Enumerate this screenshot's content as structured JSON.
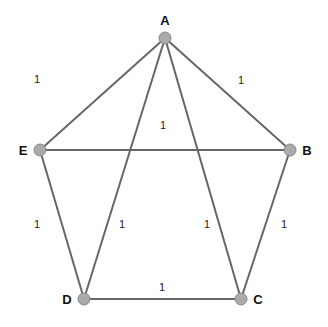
{
  "graph": {
    "nodes": [
      {
        "id": "A",
        "label": "A",
        "x": 165,
        "y": 38,
        "lx": 165,
        "ly": 25
      },
      {
        "id": "B",
        "label": "B",
        "x": 290,
        "y": 150,
        "lx": 307,
        "ly": 155
      },
      {
        "id": "C",
        "label": "C",
        "x": 241,
        "y": 299,
        "lx": 258,
        "ly": 304
      },
      {
        "id": "D",
        "label": "D",
        "x": 84,
        "y": 299,
        "lx": 67,
        "ly": 304
      },
      {
        "id": "E",
        "label": "E",
        "x": 40,
        "y": 150,
        "lx": 23,
        "ly": 155
      }
    ],
    "edges": [
      {
        "from": "A",
        "to": "E",
        "weight": "1",
        "lx": 37,
        "ly": 83
      },
      {
        "from": "A",
        "to": "B",
        "weight": "1",
        "lx": 241,
        "ly": 84
      },
      {
        "from": "E",
        "to": "B",
        "weight": "1",
        "lx": 163,
        "ly": 129
      },
      {
        "from": "E",
        "to": "D",
        "weight": "1",
        "lx": 37,
        "ly": 228
      },
      {
        "from": "A",
        "to": "D",
        "weight": "1",
        "lx": 122,
        "ly": 228
      },
      {
        "from": "A",
        "to": "C",
        "weight": "1",
        "lx": 207,
        "ly": 228
      },
      {
        "from": "B",
        "to": "C",
        "weight": "1",
        "lx": 284,
        "ly": 228
      },
      {
        "from": "D",
        "to": "C",
        "weight": "1",
        "lx": 162,
        "ly": 291
      }
    ]
  },
  "colors": {
    "edge": "#666666",
    "node_fill": "#aaaaaa",
    "label": "#111111"
  }
}
